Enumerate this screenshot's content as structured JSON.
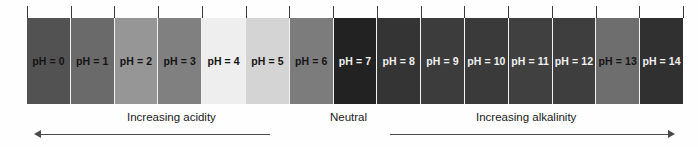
{
  "figure": {
    "name": "ph-scale",
    "background_color": "#fefefe"
  },
  "chart_data": {
    "type": "bar",
    "title": "",
    "subtitle": "",
    "xlabel": "",
    "ylabel": "",
    "orientation": "horizontal-categorical-strip",
    "grid": false,
    "legend_position": "none",
    "categories": [
      "pH = 0",
      "pH = 1",
      "pH = 2",
      "pH = 3",
      "pH = 4",
      "pH = 5",
      "pH = 6",
      "pH = 7",
      "pH = 8",
      "pH = 9",
      "pH = 10",
      "pH = 11",
      "pH = 12",
      "pH = 13",
      "pH = 14"
    ],
    "values": [
      0,
      1,
      2,
      3,
      4,
      5,
      6,
      7,
      8,
      9,
      10,
      11,
      12,
      13,
      14
    ],
    "xlim": [
      0,
      14
    ],
    "series": [
      {
        "name": "Band grey level (0-255)",
        "values": [
          82,
          106,
          150,
          128,
          238,
          212,
          124,
          34,
          52,
          60,
          58,
          64,
          62,
          110,
          48
        ]
      }
    ],
    "bands": [
      {
        "label": "pH = 0",
        "value": 0,
        "color": "#525252",
        "text_color": "#141414"
      },
      {
        "label": "pH = 1",
        "value": 1,
        "color": "#6a6a6a",
        "text_color": "#141414"
      },
      {
        "label": "pH = 2",
        "value": 2,
        "color": "#969696",
        "text_color": "#141414"
      },
      {
        "label": "pH = 3",
        "value": 3,
        "color": "#808080",
        "text_color": "#141414"
      },
      {
        "label": "pH = 4",
        "value": 4,
        "color": "#eeeeee",
        "text_color": "#141414"
      },
      {
        "label": "pH = 5",
        "value": 5,
        "color": "#d4d4d4",
        "text_color": "#141414"
      },
      {
        "label": "pH = 6",
        "value": 6,
        "color": "#7c7c7c",
        "text_color": "#141414"
      },
      {
        "label": "pH = 7",
        "value": 7,
        "color": "#222222",
        "text_color": "#f0f0f0"
      },
      {
        "label": "pH = 8",
        "value": 8,
        "color": "#343434",
        "text_color": "#f0f0f0"
      },
      {
        "label": "pH = 9",
        "value": 9,
        "color": "#3c3c3c",
        "text_color": "#f0f0f0"
      },
      {
        "label": "pH = 10",
        "value": 10,
        "color": "#3a3a3a",
        "text_color": "#f0f0f0"
      },
      {
        "label": "pH = 11",
        "value": 11,
        "color": "#404040",
        "text_color": "#f0f0f0"
      },
      {
        "label": "pH = 12",
        "value": 12,
        "color": "#3e3e3e",
        "text_color": "#f0f0f0"
      },
      {
        "label": "pH = 13",
        "value": 13,
        "color": "#6e6e6e",
        "text_color": "#141414"
      },
      {
        "label": "pH = 14",
        "value": 14,
        "color": "#303030",
        "text_color": "#f0f0f0"
      }
    ],
    "annotations": [
      {
        "text": "Increasing acidity",
        "region": "pH 0 to pH 6",
        "arrow_direction": "left"
      },
      {
        "text": "Neutral",
        "region": "pH 7",
        "arrow_direction": "none"
      },
      {
        "text": "Increasing alkalinity",
        "region": "pH 8 to pH 14",
        "arrow_direction": "right"
      }
    ]
  },
  "annotations": {
    "acidity": "Increasing acidity",
    "neutral": "Neutral",
    "alkalinity": "Increasing alkalinity"
  },
  "colors": {
    "tick": "#3a3a3a",
    "arrow": "#4a4a4a",
    "separator": "#f2f2f2",
    "annotation_text": "#1a1a1a"
  }
}
